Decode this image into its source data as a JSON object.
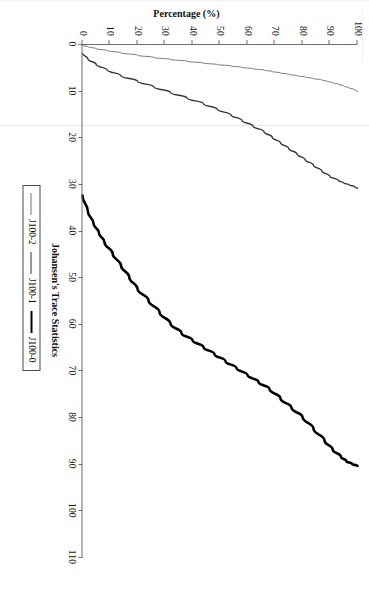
{
  "figure": {
    "caption_remnant": "..........................",
    "background_color": "#ffffff"
  },
  "chart_data": {
    "type": "line",
    "title": "",
    "xlabel": "Johansen's Trace Statistics",
    "ylabel": "Percentage (%)",
    "xlim": [
      0,
      110
    ],
    "ylim": [
      0,
      100
    ],
    "xticks": [
      0,
      10,
      20,
      30,
      40,
      50,
      60,
      70,
      80,
      90,
      100,
      110
    ],
    "xtick_labels": [
      "0",
      "10",
      "20",
      "30",
      "40",
      "50",
      "60",
      "70",
      "80",
      "90",
      "100",
      "110"
    ],
    "yticks": [
      0,
      10,
      20,
      30,
      40,
      50,
      60,
      70,
      80,
      90,
      100
    ],
    "ytick_labels": [
      "0",
      "10",
      "20",
      "30",
      "40",
      "50",
      "60",
      "70",
      "80",
      "90",
      "100"
    ],
    "grid": false,
    "legend_position": "bottom-center",
    "legend_entries": [
      "J100-2",
      "J100-1",
      "J100-0"
    ],
    "series": [
      {
        "name": "J100-2",
        "style": "thin",
        "color": "#777777",
        "width": 1.0,
        "x": [
          0.3,
          0.6,
          1.0,
          1.4,
          1.9,
          2.4,
          2.9,
          3.3,
          3.7,
          4.1,
          4.4,
          4.7,
          5.0,
          5.3,
          5.6,
          5.9,
          6.2,
          6.5,
          6.8,
          7.1,
          7.4,
          7.7,
          8.0,
          8.3,
          8.6,
          9.0,
          9.4,
          9.8,
          10.2
        ],
        "y": [
          0,
          2,
          5,
          9,
          14,
          20,
          26,
          32,
          38,
          44,
          49,
          54,
          58,
          62,
          66,
          69,
          72,
          75,
          78,
          81,
          84,
          87,
          89,
          91,
          93,
          95,
          97,
          99,
          100
        ]
      },
      {
        "name": "J100-1",
        "style": "medium",
        "color": "#333333",
        "width": 1.4,
        "x": [
          2.0,
          3.2,
          4.4,
          5.6,
          6.8,
          8.0,
          9.2,
          10.4,
          11.6,
          12.8,
          14.0,
          15.2,
          16.4,
          17.6,
          18.8,
          20.0,
          21.2,
          22.4,
          23.6,
          24.8,
          26.0,
          27.2,
          28.4,
          29.2,
          29.8,
          30.2,
          30.6,
          31.0
        ],
        "y": [
          0,
          2,
          5,
          9,
          14,
          20,
          26,
          32,
          38,
          44,
          49,
          54,
          58,
          62,
          66,
          69,
          72,
          75,
          78,
          81,
          84,
          87,
          90,
          93,
          95,
          97,
          99,
          100
        ]
      },
      {
        "name": "J100-0",
        "style": "bold",
        "color": "#000000",
        "width": 2.6,
        "x": [
          32.5,
          36.0,
          38.5,
          40.5,
          42.5,
          45.0,
          47.5,
          50.0,
          52.5,
          55.0,
          57.5,
          60.0,
          62.0,
          63.5,
          65.0,
          66.5,
          68.0,
          69.5,
          71.0,
          72.5,
          74.0,
          76.0,
          78.0,
          80.0,
          82.5,
          85.0,
          87.0,
          88.5,
          89.5,
          90.0,
          90.5
        ],
        "y": [
          0,
          2,
          4,
          6,
          8,
          11,
          14,
          17,
          20,
          24,
          28,
          32,
          36,
          40,
          44,
          48,
          52,
          56,
          60,
          64,
          68,
          72,
          76,
          80,
          84,
          88,
          91,
          94,
          96,
          98,
          100
        ]
      }
    ]
  }
}
